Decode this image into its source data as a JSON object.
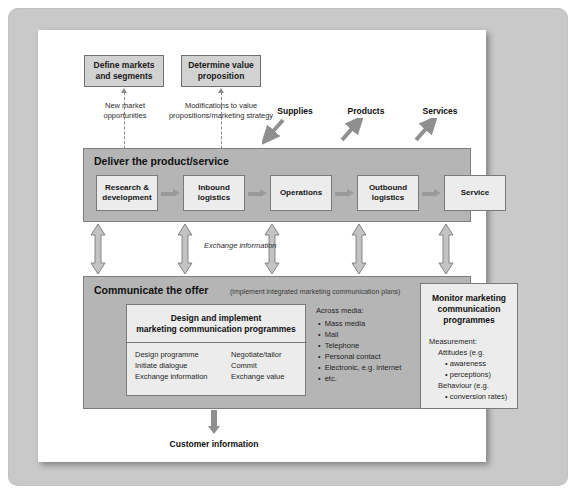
{
  "diagram": {
    "colors": {
      "frame": "#c9c9c9",
      "page": "#ffffff",
      "band": "#b5b5b5",
      "box_top": "#d2d2d2",
      "box_inner": "#ececec",
      "arrow": "#9a9a9a",
      "border": "#7a7a7a"
    },
    "top_boxes": [
      {
        "label": "Define markets and segments"
      },
      {
        "label": "Determine value proposition"
      }
    ],
    "feedback_captions": [
      {
        "line1": "New market",
        "line2": "opportunities"
      },
      {
        "line1": "Modifications to value",
        "line2": "propositions/marketing strategy"
      }
    ],
    "io_labels": [
      {
        "label": "Supplies",
        "direction": "in"
      },
      {
        "label": "Products",
        "direction": "out"
      },
      {
        "label": "Services",
        "direction": "out"
      }
    ],
    "deliver": {
      "title": "Deliver the product/service",
      "chain": [
        {
          "label": "Research & development"
        },
        {
          "label": "Inbound logistics"
        },
        {
          "label": "Operations"
        },
        {
          "label": "Outbound logistics"
        },
        {
          "label": "Service"
        }
      ]
    },
    "exchange_label": "Exchange information",
    "communicate": {
      "title": "Communicate the offer",
      "subtitle": "(implement integrated marketing communication plans)",
      "design_box": {
        "title_line1": "Design and implement",
        "title_line2": "marketing communication programmes",
        "left_items": [
          "Design programme",
          "Initiate dialogue",
          "Exchange information"
        ],
        "right_items": [
          "Negotiate/tailor",
          "Commit",
          "Exchange value"
        ]
      },
      "media": {
        "heading": "Across media:",
        "items": [
          "Mass media",
          "Mail",
          "Telephone",
          "Personal contact",
          "Electronic, e.g. internet",
          "etc."
        ]
      },
      "monitor_box": {
        "title_line1": "Monitor marketing",
        "title_line2": "communication",
        "title_line3": "programmes",
        "lines": [
          {
            "text": "Measurement:",
            "indent": 0,
            "bullet": false
          },
          {
            "text": "Attitudes (e.g.",
            "indent": 1,
            "bullet": false
          },
          {
            "text": "awareness",
            "indent": 2,
            "bullet": true
          },
          {
            "text": "perceptions)",
            "indent": 2,
            "bullet": true
          },
          {
            "text": "Behaviour (e.g.",
            "indent": 1,
            "bullet": false
          },
          {
            "text": "conversion rates)",
            "indent": 2,
            "bullet": true
          }
        ]
      }
    },
    "output_label": "Customer information"
  }
}
